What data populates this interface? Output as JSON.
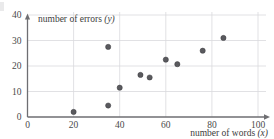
{
  "chart_data": {
    "type": "scatter",
    "title": "",
    "xlabel": "number of words (x)",
    "ylabel": "number of errors (y)",
    "xlabel_text": "number of words",
    "xlabel_var": "(x)",
    "ylabel_text": "number of errors",
    "ylabel_var": "(y)",
    "xlim": [
      0,
      100
    ],
    "ylim": [
      0,
      40
    ],
    "xticks": [
      0,
      20,
      40,
      60,
      80,
      100
    ],
    "yticks": [
      0,
      10,
      20,
      30,
      40
    ],
    "xtick_labels": [
      "0",
      "20",
      "40",
      "60",
      "80",
      "100"
    ],
    "ytick_labels": [
      "0",
      "10",
      "20",
      "30",
      "40"
    ],
    "grid": true,
    "grid_color": "#d9d9dd",
    "axis_color": "#6e6e72",
    "point_color": "#5a5a5e",
    "legend": null,
    "points": [
      {
        "x": 20,
        "y": 2
      },
      {
        "x": 35,
        "y": 4.5
      },
      {
        "x": 35,
        "y": 27.5
      },
      {
        "x": 40,
        "y": 11.5
      },
      {
        "x": 49,
        "y": 16.5
      },
      {
        "x": 53,
        "y": 15.5
      },
      {
        "x": 60,
        "y": 22.5
      },
      {
        "x": 65,
        "y": 20.7
      },
      {
        "x": 76,
        "y": 26
      },
      {
        "x": 85,
        "y": 31
      }
    ]
  },
  "axis": {
    "y_caption": "number of errors",
    "y_caption_var": "(y)",
    "x_caption": "number of words",
    "x_caption_var": "(x)"
  }
}
